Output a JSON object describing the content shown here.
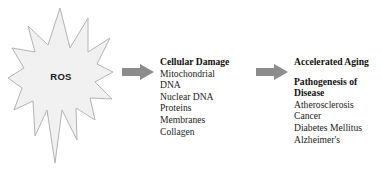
{
  "diagram": {
    "source_node": {
      "label": "ROS",
      "shape": "starburst",
      "fill_color": "#f1f1f1",
      "stroke_color": "#b4b4b4"
    },
    "arrows": [
      {
        "name": "arrow-ros-to-cellular-damage",
        "color": "#8c8c8c",
        "direction": "right"
      },
      {
        "name": "arrow-cellular-damage-to-aging",
        "color": "#8c8c8c",
        "direction": "right"
      }
    ],
    "columns": [
      {
        "id": "cellular-damage",
        "heading": "Cellular Damage",
        "items": [
          "Mitochondrial",
          "DNA",
          "Nuclear DNA",
          "Proteins",
          "Membranes",
          "Collagen"
        ]
      },
      {
        "id": "accelerated-aging",
        "heading": "Accelerated Aging",
        "subheading_line1": "Pathogenesis of",
        "subheading_line2": "Disease",
        "items": [
          "Atherosclerosis",
          "Cancer",
          "Diabetes Mellitus",
          "Alzheimer's"
        ]
      }
    ]
  }
}
